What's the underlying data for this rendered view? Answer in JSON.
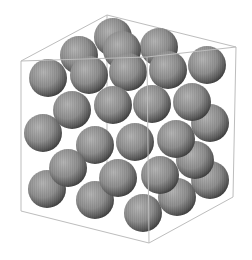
{
  "scene": {
    "description": "3D render of packed grey spheres inside a wireframe cube",
    "background": "#ffffff",
    "sphere_color_light": "#c8c8c8",
    "sphere_color_mid": "#8a8a8a",
    "sphere_color_dark": "#3a3a3a",
    "edge_color": "#bdbdbd",
    "sphere_radius": 19,
    "cube_edges_back": [
      [
        107,
        15,
        236,
        47
      ],
      [
        107,
        15,
        21,
        61
      ],
      [
        107,
        15,
        107,
        165
      ]
    ],
    "cube_edges_front": [
      [
        21,
        61,
        147,
        57
      ],
      [
        147,
        57,
        236,
        47
      ],
      [
        21,
        61,
        21,
        211
      ],
      [
        21,
        211,
        149,
        243
      ],
      [
        149,
        243,
        233,
        197
      ],
      [
        233,
        197,
        236,
        47
      ],
      [
        147,
        57,
        149,
        243
      ]
    ],
    "spheres": [
      [
        113,
        37
      ],
      [
        79,
        55
      ],
      [
        159,
        47
      ],
      [
        122,
        50
      ],
      [
        48,
        78
      ],
      [
        89,
        75
      ],
      [
        128,
        72
      ],
      [
        168,
        70
      ],
      [
        207,
        65
      ],
      [
        43,
        133
      ],
      [
        210,
        123
      ],
      [
        72,
        110
      ],
      [
        113,
        105
      ],
      [
        152,
        104
      ],
      [
        192,
        102
      ],
      [
        47,
        189
      ],
      [
        210,
        180
      ],
      [
        195,
        160
      ],
      [
        95,
        145
      ],
      [
        135,
        142
      ],
      [
        176,
        139
      ],
      [
        68,
        168
      ],
      [
        95,
        200
      ],
      [
        177,
        197
      ],
      [
        118,
        178
      ],
      [
        160,
        175
      ],
      [
        143,
        213
      ]
    ]
  }
}
